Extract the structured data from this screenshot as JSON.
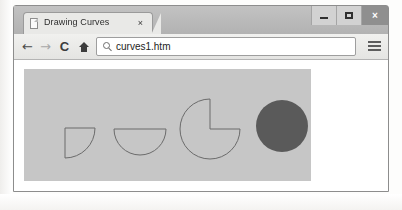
{
  "window": {
    "controls": {
      "minimize_label": "–",
      "maximize_label": "",
      "close_label": "×"
    }
  },
  "tabs": [
    {
      "title": "Drawing Curves",
      "close_label": "×",
      "favicon": "page-icon",
      "active": true
    }
  ],
  "toolbar": {
    "back_label": "←",
    "forward_label": "→",
    "reload_label": "C",
    "home_label": "home-icon",
    "menu_label": "hamburger-menu-icon"
  },
  "address_bar": {
    "value": "curves1.htm",
    "placeholder": "Search or type URL",
    "search_icon": "magnifier-icon"
  },
  "canvas": {
    "background_color": "#c6c6c6",
    "stroke_color": "#6b6b6b",
    "fill_color": "#5a5a5a",
    "width": 287,
    "height": 112,
    "shapes": [
      {
        "name": "quarter-pie-shape",
        "type": "arc-quarter",
        "cx": 41,
        "cy": 59,
        "r": 30,
        "start_deg": 0,
        "end_deg": 90,
        "filled": false
      },
      {
        "name": "semicircle-shape",
        "type": "arc-half",
        "cx": 116,
        "cy": 60,
        "r": 26,
        "start_deg": 0,
        "end_deg": 180,
        "filled": false
      },
      {
        "name": "three-quarter-pie-shape",
        "type": "arc-three-quarter",
        "cx": 186,
        "cy": 60,
        "r": 30,
        "start_deg": 0,
        "end_deg": 270,
        "filled": false
      },
      {
        "name": "filled-circle-shape",
        "type": "circle",
        "cx": 258,
        "cy": 57,
        "r": 26,
        "filled": true
      }
    ]
  }
}
